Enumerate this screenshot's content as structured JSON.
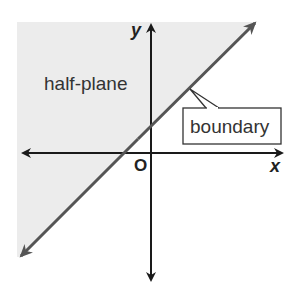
{
  "diagram": {
    "region_label": "half-plane",
    "boundary_label": "boundary",
    "x_axis_label": "x",
    "y_axis_label": "y",
    "origin_label": "O",
    "shaded_side": "above-left of boundary",
    "colors": {
      "shade": "#ececec",
      "line": "#555555",
      "axis": "#1a1a1a",
      "callout_border": "#333333"
    }
  }
}
